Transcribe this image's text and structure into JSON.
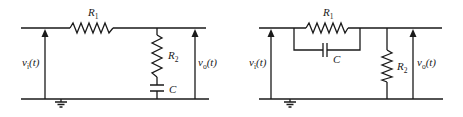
{
  "figure": {
    "type": "circuit-diagrams",
    "count": 2
  },
  "circuits": [
    {
      "id": "left",
      "description": "Series R1 with shunt branch of R2 in series with C to ground",
      "components": {
        "r1": {
          "label": "R",
          "subscript": "1"
        },
        "r2": {
          "label": "R",
          "subscript": "2"
        },
        "c": {
          "label": "C"
        }
      },
      "input": {
        "label": "v",
        "subscript": "i",
        "arg": "(t)"
      },
      "output": {
        "label": "v",
        "subscript": "o",
        "arg": "(t)"
      },
      "ground": true
    },
    {
      "id": "right",
      "description": "R1 in parallel with C in series path, shunt R2 to ground",
      "components": {
        "r1": {
          "label": "R",
          "subscript": "1"
        },
        "r2": {
          "label": "R",
          "subscript": "2"
        },
        "c": {
          "label": "C"
        }
      },
      "input": {
        "label": "v",
        "subscript": "i",
        "arg": "(t)"
      },
      "output": {
        "label": "v",
        "subscript": "o",
        "arg": "(t)"
      },
      "ground": true
    }
  ],
  "colors": {
    "line": "#1a1a1a",
    "background": "#ffffff"
  }
}
